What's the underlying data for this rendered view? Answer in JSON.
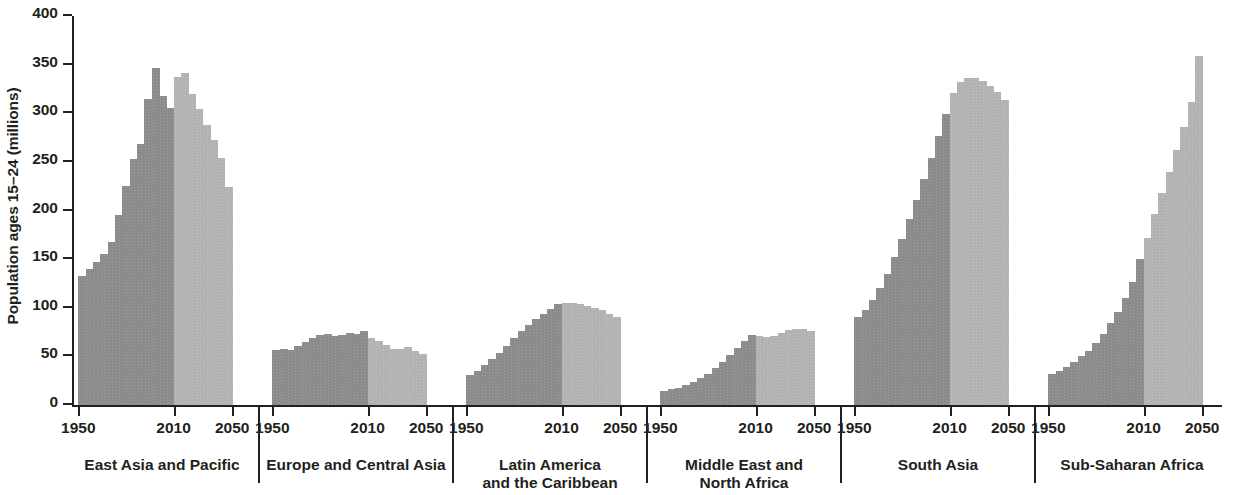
{
  "chart": {
    "type": "bar",
    "ylabel": "Population ages 15–24 (millions)",
    "ylim": [
      0,
      400
    ],
    "ytick_labels": [
      "0",
      "50",
      "100",
      "150",
      "200",
      "250",
      "300",
      "350",
      "400"
    ],
    "xtick_labels": [
      "1950",
      "2010",
      "2050"
    ],
    "colors": {
      "historical": "#8b8b8b",
      "projection": "#b2b2b2",
      "axis": "#231f20",
      "background": "#ffffff"
    }
  },
  "chart_data": {
    "type": "bar",
    "title": "",
    "subtitle": "",
    "xlabel": "",
    "ylabel": "Population ages 15–24 (millions)",
    "ylim": [
      0,
      400
    ],
    "yticks": [
      0,
      50,
      100,
      150,
      200,
      250,
      300,
      350,
      400
    ],
    "grid": false,
    "legend": "none",
    "x": [
      1950,
      1955,
      1960,
      1965,
      1970,
      1975,
      1980,
      1985,
      1990,
      1995,
      2000,
      2005,
      2010,
      2015,
      2020,
      2025,
      2030,
      2035,
      2040,
      2045,
      2050
    ],
    "xtick_labels": [
      "1950",
      "2010",
      "2050"
    ],
    "series_split_year": 2010,
    "panels": [
      {
        "label": "East Asia and Pacific",
        "label_lines": [
          "East Asia and Pacific"
        ],
        "values": [
          133,
          140,
          147,
          155,
          168,
          195,
          225,
          253,
          268,
          315,
          347,
          318,
          305,
          337,
          341,
          320,
          304,
          288,
          273,
          254,
          224
        ]
      },
      {
        "label": "Europe and Central Asia",
        "label_lines": [
          "Europe and Central Asia"
        ],
        "values": [
          57,
          58,
          57,
          61,
          65,
          69,
          72,
          73,
          71,
          72,
          74,
          73,
          76,
          69,
          66,
          62,
          58,
          58,
          60,
          56,
          52
        ]
      },
      {
        "label": "Latin America and the Caribbean",
        "label_lines": [
          "Latin America",
          "and the Caribbean"
        ],
        "values": [
          31,
          35,
          41,
          47,
          54,
          61,
          69,
          76,
          82,
          88,
          94,
          99,
          104,
          105,
          105,
          104,
          102,
          100,
          98,
          94,
          90
        ]
      },
      {
        "label": "Middle East and North Africa",
        "label_lines": [
          "Middle East and",
          "North Africa"
        ],
        "values": [
          14,
          16,
          18,
          21,
          24,
          28,
          32,
          38,
          44,
          51,
          59,
          66,
          72,
          71,
          70,
          71,
          74,
          77,
          78,
          78,
          76
        ]
      },
      {
        "label": "South Asia",
        "label_lines": [
          "South Asia"
        ],
        "values": [
          90,
          98,
          108,
          120,
          135,
          152,
          171,
          191,
          211,
          232,
          254,
          277,
          299,
          321,
          332,
          336,
          336,
          333,
          328,
          322,
          314
        ]
      },
      {
        "label": "Sub-Saharan Africa",
        "label_lines": [
          "Sub-Saharan Africa"
        ],
        "values": [
          32,
          35,
          39,
          44,
          50,
          56,
          64,
          73,
          84,
          96,
          110,
          126,
          150,
          172,
          196,
          218,
          240,
          262,
          286,
          312,
          359
        ]
      }
    ]
  }
}
